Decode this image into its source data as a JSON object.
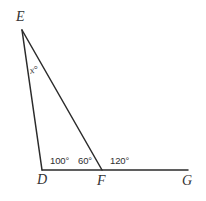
{
  "figure": {
    "background_color": "#ffffff",
    "stroke_color": "#2b2b2b",
    "stroke_width": 1.5,
    "canvas": {
      "width": 206,
      "height": 201
    }
  },
  "points": {
    "E": {
      "label": "E",
      "x": 22,
      "y": 30
    },
    "D": {
      "label": "D",
      "x": 42,
      "y": 170
    },
    "F": {
      "label": "F",
      "x": 102,
      "y": 170
    },
    "G": {
      "label": "G",
      "x": 188,
      "y": 170
    }
  },
  "segments": [
    {
      "name": "segment-ED",
      "from": "E",
      "to": "D",
      "x1": 22,
      "y1": 30,
      "x2": 42,
      "y2": 170
    },
    {
      "name": "segment-EF",
      "from": "E",
      "to": "F",
      "x1": 22,
      "y1": 30,
      "x2": 102,
      "y2": 170
    },
    {
      "name": "segment-DG",
      "from": "D",
      "to": "G",
      "x1": 42,
      "y1": 170,
      "x2": 188,
      "y2": 170
    }
  ],
  "angles": {
    "at_D": "100°",
    "at_F_interior": "60°",
    "at_F_exterior": "120°",
    "at_E_unknown": "x°"
  }
}
